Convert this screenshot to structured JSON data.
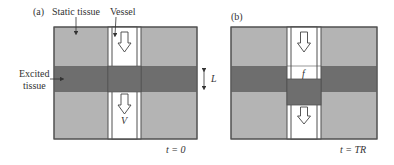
{
  "panel_a": {
    "label": "(a)",
    "static_tissue_label": "Static tissue",
    "vessel_label": "Vessel",
    "excited_label_line1": "Excited",
    "excited_label_line2": "tissue",
    "velocity_label": "V",
    "thickness_label": "L",
    "time_label": "t = 0"
  },
  "panel_b": {
    "label": "(b)",
    "fraction_label": "f",
    "time_label": "t = TR"
  },
  "colors": {
    "static_tissue": "#b4b4b4",
    "excited_tissue": "#6e6e6e",
    "vessel": "#ffffff",
    "outline": "#505050"
  }
}
